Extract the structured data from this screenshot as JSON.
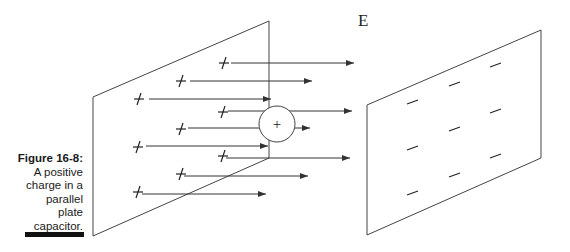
{
  "caption": {
    "figure_label": "Figure 16-8:",
    "lines": [
      "A positive",
      "charge in a",
      "parallel",
      "plate",
      "capacitor."
    ]
  },
  "diagram": {
    "field_label": "E",
    "charge_symbol": "+",
    "left_plate_label": "positive plate",
    "right_plate_label": "negative plate",
    "colors": {
      "line": "#333333",
      "text": "#222222"
    }
  }
}
